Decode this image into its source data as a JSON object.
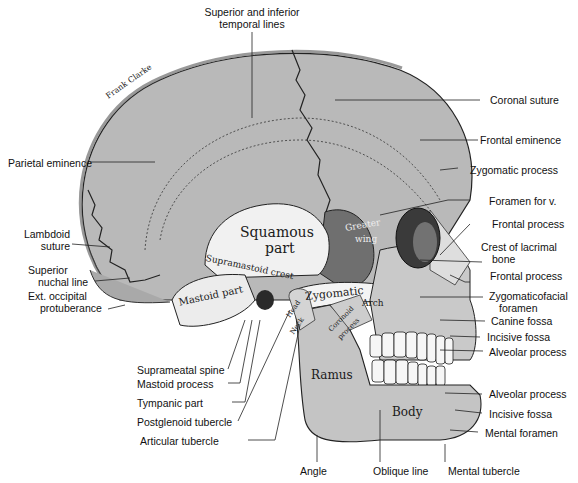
{
  "figure": {
    "signature": "Frank Clarke",
    "colors": {
      "bone": "#b9b9b9",
      "bone_light": "#d6d6d6",
      "squamous": "#f1f1f1",
      "greater_wing": "#6f6f6f",
      "orbit": "#3a3a3a",
      "mandible": "#c4c4c4",
      "line": "#222222",
      "background": "#ffffff"
    }
  },
  "labels": {
    "top": {
      "temporal_lines": [
        "Superior and inferior",
        "temporal lines"
      ]
    },
    "left": {
      "parietal_eminence": "Parietal eminence",
      "lambdoid_suture": [
        "Lambdoid",
        "suture"
      ],
      "superior_nuchal_line": [
        "Superior",
        "nuchal line"
      ],
      "ext_occipital_protuberance": [
        "Ext. occipital",
        "protuberance"
      ]
    },
    "right": {
      "coronal_suture": "Coronal suture",
      "frontal_eminence": "Frontal eminence",
      "zygomatic_process": "Zygomatic process",
      "foramen_for_v": "Foramen for v.",
      "frontal_process_1": "Frontal process",
      "crest_of_lacrimal_bone": [
        "Crest of lacrimal",
        "bone"
      ],
      "frontal_process_2": "Frontal process",
      "zygomaticofacial_foramen": [
        "Zygomaticofacial",
        "foramen"
      ],
      "canine_fossa": "Canine fossa",
      "incisive_fossa_1": "Incisive fossa",
      "alveolar_process_1": "Alveolar process",
      "alveolar_process_2": "Alveolar process",
      "incisive_fossa_2": "Incisive fossa",
      "mental_foramen": "Mental foramen"
    },
    "bottom_left": {
      "suprameatal_spine": "Suprameatal spine",
      "mastoid_process": "Mastoid process",
      "tympanic_part": "Tympanic part",
      "postglenoid_tubercle": "Postglenoid tubercle",
      "articular_tubercle": "Articular tubercle"
    },
    "bottom": {
      "angle": "Angle",
      "oblique_line": "Oblique line",
      "mental_tubercle": "Mental tubercle"
    },
    "inside": {
      "squamous_part": [
        "Squamous",
        "part"
      ],
      "greater_wing": [
        "Greater",
        "wing"
      ],
      "supramastoid_crest": "Supramastoid crest",
      "mastoid_part": "Mastoid part",
      "zygomatic": "Zygomatic",
      "arch": "Arch",
      "head": "Head",
      "neck": "Neck",
      "coronoid_process": [
        "Coronoid",
        "process"
      ],
      "ramus": "Ramus",
      "body": "Body"
    }
  }
}
